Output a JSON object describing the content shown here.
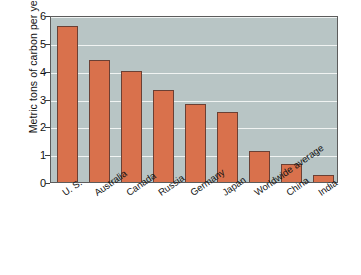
{
  "chart_data": {
    "type": "bar",
    "title": "",
    "xlabel": "",
    "ylabel": "Metric tons of carbon per year",
    "ylim": [
      0,
      6
    ],
    "yticks": [
      "0",
      "1",
      "2",
      "3",
      "4",
      "5",
      "6"
    ],
    "grid": true,
    "legend": "none",
    "categories": [
      "U. S.",
      "Australia",
      "Canada",
      "Russia",
      "Germany",
      "Japan",
      "Worldwide average",
      "China",
      "India"
    ],
    "values": [
      5.6,
      4.4,
      4.0,
      3.3,
      2.8,
      2.5,
      1.1,
      0.65,
      0.25
    ],
    "colors": {
      "bar_fill": "#d9714c",
      "bar_edge": "#6b4034",
      "plot_background": "#b8c5c5",
      "gridline": "#f2f5f4",
      "axis": "#5c5c5c",
      "text": "#111111",
      "page_background": "#ffffff"
    }
  }
}
